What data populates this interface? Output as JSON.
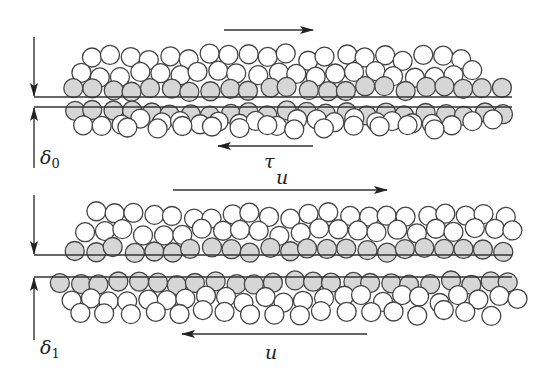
{
  "figure": {
    "colors": {
      "line": "#333333",
      "grain_fill_white": "#ffffff",
      "grain_fill_shaded": "#d6d6d6",
      "grain_stroke": "#444444"
    },
    "top_panel": {
      "gap_label_symbol": "δ",
      "gap_label_sub": "0",
      "shear_label": "τ",
      "velocity_label": "u",
      "interface_lines_y": [
        97,
        107
      ],
      "arrow_top": {
        "x1": 224,
        "x2": 313,
        "y": 30,
        "direction": "right"
      },
      "arrow_bottom": {
        "x1": 218,
        "x2": 313,
        "y": 146,
        "direction": "left"
      }
    },
    "bottom_panel": {
      "gap_label_symbol": "δ",
      "gap_label_sub": "1",
      "velocity_top_label": "u",
      "velocity_bottom_label": "u",
      "interface_lines_y": [
        255,
        277
      ],
      "arrow_top": {
        "x1": 173,
        "x2": 387,
        "y": 190,
        "direction": "right"
      },
      "arrow_bottom": {
        "x1": 182,
        "x2": 367,
        "y": 334,
        "direction": "left"
      }
    }
  }
}
